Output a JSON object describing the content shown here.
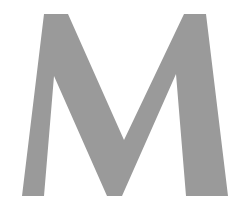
{
  "image": {
    "glyph": "M",
    "glyph_color": "#9a9a9a",
    "background_color": "#ffffff"
  }
}
